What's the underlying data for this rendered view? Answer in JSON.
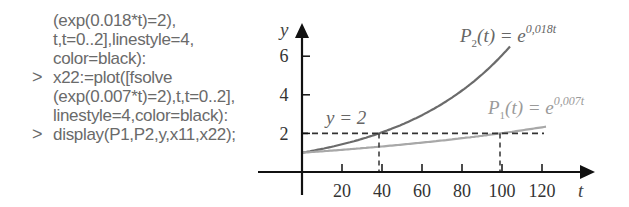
{
  "code_panel": {
    "lines": [
      {
        "prompt": "",
        "text": "(exp(0.018*t)=2),"
      },
      {
        "prompt": "",
        "text": "t,t=0..2],linestyle=4,"
      },
      {
        "prompt": "",
        "text": "color=black):"
      },
      {
        "prompt": ">",
        "text": "x22:=plot([fsolve"
      },
      {
        "prompt": "",
        "text": "(exp(0.007*t)=2),t,t=0..2],"
      },
      {
        "prompt": "",
        "text": "linestyle=4,color=black):"
      },
      {
        "prompt": ">",
        "text": "display(P1,P2,y,x11,x22);"
      }
    ]
  },
  "chart_data": {
    "type": "line",
    "title": "",
    "xlabel": "t",
    "ylabel": "y",
    "xlim": [
      0,
      140
    ],
    "ylim": [
      0,
      7.5
    ],
    "x_ticks": [
      20,
      40,
      60,
      80,
      100,
      120
    ],
    "y_ticks": [
      2,
      4,
      6
    ],
    "grid": false,
    "series": [
      {
        "name": "P2(t) = e^{0.018t}",
        "label_main": "P",
        "label_sub": "2",
        "label_rest": "(t) = e",
        "label_sup": "0,018t",
        "color": "#6b6b6b",
        "x": [
          0,
          20,
          40,
          60,
          80,
          100,
          120
        ],
        "values": [
          1.0,
          1.43,
          2.05,
          2.94,
          4.22,
          6.05,
          8.67
        ]
      },
      {
        "name": "P1(t) = e^{0.007t}",
        "label_main": "P",
        "label_sub": "1",
        "label_rest": "(t) = e",
        "label_sup": "0,007t",
        "color": "#a8a8a8",
        "x": [
          0,
          20,
          40,
          60,
          80,
          100,
          120
        ],
        "values": [
          1.0,
          1.15,
          1.32,
          1.52,
          1.75,
          2.01,
          2.32
        ]
      },
      {
        "name": "y = 2",
        "label": "y = 2",
        "style": "dashed",
        "color": "#333333",
        "x": [
          0,
          120
        ],
        "values": [
          2,
          2
        ]
      }
    ],
    "annotations": [
      {
        "type": "vertical-dashed",
        "x": 38.5,
        "from_y": 0,
        "to_y": 2,
        "note": "solution of exp(0.018t)=2"
      },
      {
        "type": "vertical-dashed",
        "x": 99,
        "from_y": 0,
        "to_y": 2,
        "note": "solution of exp(0.007t)=2"
      }
    ]
  }
}
